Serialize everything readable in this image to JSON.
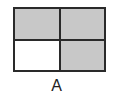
{
  "figure": {
    "label": "A",
    "rows": 2,
    "cols": 2,
    "cells": [
      {
        "row": 0,
        "col": 0,
        "shaded": true
      },
      {
        "row": 0,
        "col": 1,
        "shaded": true
      },
      {
        "row": 1,
        "col": 0,
        "shaded": false
      },
      {
        "row": 1,
        "col": 1,
        "shaded": true
      }
    ],
    "colors": {
      "shaded": "#c8c8c8",
      "unshaded": "#ffffff",
      "border": "#2a2a2a"
    }
  }
}
